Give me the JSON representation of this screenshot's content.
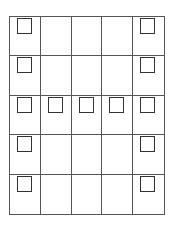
{
  "diagram": {
    "rows": 5,
    "cols": 5,
    "line_color": "#555555",
    "square_color": "#333333",
    "filled": [
      [
        1,
        0,
        0,
        0,
        1
      ],
      [
        1,
        0,
        0,
        0,
        1
      ],
      [
        1,
        1,
        1,
        1,
        1
      ],
      [
        1,
        0,
        0,
        0,
        1
      ],
      [
        1,
        0,
        0,
        0,
        1
      ]
    ]
  }
}
